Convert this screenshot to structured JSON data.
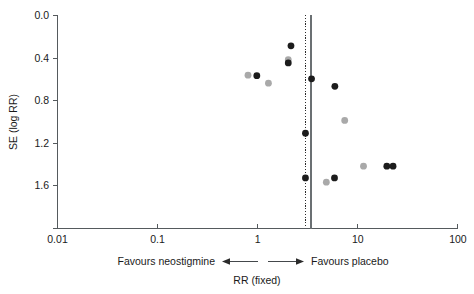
{
  "chart_data": {
    "type": "scatter",
    "title": "",
    "subtitle": "",
    "xlabel": "RR (fixed)",
    "ylabel": "SE (log RR)",
    "xscale": "log",
    "xlim": [
      0.01,
      100
    ],
    "ylim": [
      0.0,
      2.0
    ],
    "y_inverted": true,
    "grid": false,
    "legend": "none",
    "x_ticks": [
      "0.01",
      "0.1",
      "1",
      "10",
      "100"
    ],
    "x_tick_values": [
      0.01,
      0.1,
      1,
      10,
      100
    ],
    "y_ticks": [
      "0.0",
      "0.4",
      "0.8",
      "1.2",
      "1.6"
    ],
    "y_tick_values": [
      0.0,
      0.4,
      0.8,
      1.2,
      1.6
    ],
    "reference_lines": [
      {
        "name": "pooled-effect-dotted",
        "x": 3.0,
        "style": "dotted",
        "color": "#2b2b2b"
      },
      {
        "name": "pooled-effect-solid",
        "x": 3.4,
        "style": "solid",
        "color": "#6b7073"
      }
    ],
    "series": [
      {
        "name": "dark-studies",
        "color": "#1c1c1c",
        "marker": "circle",
        "points": [
          {
            "x": 2.15,
            "y": 0.285
          },
          {
            "x": 2.02,
            "y": 0.445
          },
          {
            "x": 0.98,
            "y": 0.565
          },
          {
            "x": 3.45,
            "y": 0.595
          },
          {
            "x": 5.9,
            "y": 0.665
          },
          {
            "x": 3.0,
            "y": 1.105
          },
          {
            "x": 3.0,
            "y": 1.525
          },
          {
            "x": 5.85,
            "y": 1.525
          },
          {
            "x": 19.5,
            "y": 1.415
          },
          {
            "x": 22.5,
            "y": 1.415
          }
        ]
      },
      {
        "name": "light-studies",
        "color": "#a9a9a9",
        "marker": "circle",
        "points": [
          {
            "x": 2.02,
            "y": 0.415
          },
          {
            "x": 0.8,
            "y": 0.56
          },
          {
            "x": 1.28,
            "y": 0.635
          },
          {
            "x": 7.4,
            "y": 0.985
          },
          {
            "x": 11.4,
            "y": 1.415
          },
          {
            "x": 4.85,
            "y": 1.565
          }
        ]
      }
    ],
    "annotations": [
      {
        "name": "favours-left",
        "text": "Favours neostigmine"
      },
      {
        "name": "favours-right",
        "text": "Favours placebo"
      }
    ]
  },
  "axes": {
    "y_title": "SE (log RR)",
    "x_title": "RR (fixed)",
    "y_labels": [
      "0.0",
      "0.4",
      "0.8",
      "1.2",
      "1.6"
    ],
    "x_labels": [
      "0.01",
      "0.1",
      "1",
      "10",
      "100"
    ]
  },
  "footer": {
    "left_label": "Favours neostigmine",
    "right_label": "Favours placebo",
    "axis_caption": "RR (fixed)"
  },
  "colors": {
    "dark_marker": "#1c1c1c",
    "light_marker": "#a9a9a9",
    "axis": "#555a5d",
    "reference_solid": "#6b7073",
    "reference_dotted": "#2b2b2b",
    "background": "#ffffff"
  }
}
